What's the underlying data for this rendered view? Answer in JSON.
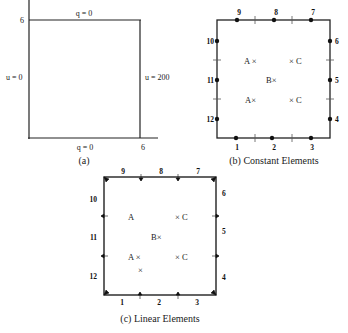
{
  "panel_a": {
    "caption": "(a)",
    "top_label": "q = 0",
    "bottom_label": "q = 0",
    "left_label": "u = 0",
    "right_label": "u = 200",
    "y_tick": "6",
    "x_tick": "6"
  },
  "panel_b": {
    "caption": "(b)  Constant Elements",
    "nodes": [
      "1",
      "2",
      "3",
      "4",
      "5",
      "6",
      "7",
      "8",
      "9",
      "10",
      "11",
      "12"
    ],
    "points": {
      "a_upper": "A ×",
      "c_upper": "× C",
      "b": "B×",
      "a_lower": "A×",
      "c_lower": "× C"
    }
  },
  "panel_c": {
    "caption": "(c)  Linear Elements",
    "elements": [
      "1",
      "2",
      "3",
      "4",
      "5",
      "6",
      "7",
      "8",
      "9",
      "10",
      "11",
      "12"
    ],
    "points": {
      "a_upper": "A",
      "c_upper": "× C",
      "b": "B×",
      "a_lower": "A ×",
      "extra": "×",
      "c_lower": "× C"
    }
  }
}
